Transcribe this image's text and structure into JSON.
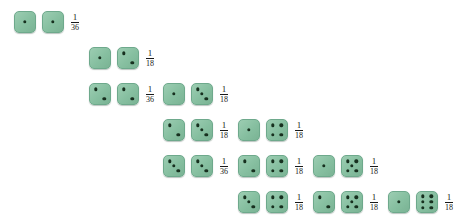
{
  "figure": {
    "kind": "dice-pair-probability-array",
    "die_color": "#86bfa0",
    "die_border_color": "#6ea98c",
    "pip_color": "#17301f",
    "background": "#ffffff",
    "columns": [
      {
        "index": 1,
        "x": 14,
        "outcomes": [
          {
            "die1": 1,
            "die2": 1,
            "numerator": "1",
            "denominator": "36"
          }
        ]
      },
      {
        "index": 2,
        "x": 89,
        "outcomes": [
          {
            "die1": 1,
            "die2": 2,
            "numerator": "1",
            "denominator": "18"
          },
          {
            "die1": 2,
            "die2": 2,
            "numerator": "1",
            "denominator": "36"
          }
        ]
      },
      {
        "index": 3,
        "x": 163,
        "outcomes": [
          {
            "die1": 1,
            "die2": 3,
            "numerator": "1",
            "denominator": "18"
          },
          {
            "die1": 2,
            "die2": 3,
            "numerator": "1",
            "denominator": "18"
          },
          {
            "die1": 3,
            "die2": 3,
            "numerator": "1",
            "denominator": "36"
          }
        ]
      },
      {
        "index": 4,
        "x": 238,
        "outcomes": [
          {
            "die1": 1,
            "die2": 4,
            "numerator": "1",
            "denominator": "18"
          },
          {
            "die1": 2,
            "die2": 4,
            "numerator": "1",
            "denominator": "18"
          },
          {
            "die1": 3,
            "die2": 4,
            "numerator": "1",
            "denominator": "18"
          },
          {
            "die1": 4,
            "die2": 4,
            "numerator": "1",
            "denominator": "36"
          }
        ]
      },
      {
        "index": 5,
        "x": 313,
        "outcomes": [
          {
            "die1": 1,
            "die2": 5,
            "numerator": "1",
            "denominator": "18"
          },
          {
            "die1": 2,
            "die2": 5,
            "numerator": "1",
            "denominator": "18"
          },
          {
            "die1": 3,
            "die2": 5,
            "numerator": "1",
            "denominator": "18"
          },
          {
            "die1": 4,
            "die2": 5,
            "numerator": "1",
            "denominator": "18"
          },
          {
            "die1": 5,
            "die2": 5,
            "numerator": "1",
            "denominator": "36"
          }
        ]
      },
      {
        "index": 6,
        "x": 388,
        "outcomes": [
          {
            "die1": 1,
            "die2": 6,
            "numerator": "1",
            "denominator": "18"
          },
          {
            "die1": 2,
            "die2": 6,
            "numerator": "1",
            "denominator": "18"
          },
          {
            "die1": 3,
            "die2": 6,
            "numerator": "1",
            "denominator": "18"
          },
          {
            "die1": 4,
            "die2": 6,
            "numerator": "1",
            "denominator": "18"
          },
          {
            "die1": 5,
            "die2": 6,
            "numerator": "1",
            "denominator": "18"
          },
          {
            "die1": 6,
            "die2": 6,
            "numerator": "1",
            "denominator": "36"
          }
        ]
      }
    ]
  }
}
